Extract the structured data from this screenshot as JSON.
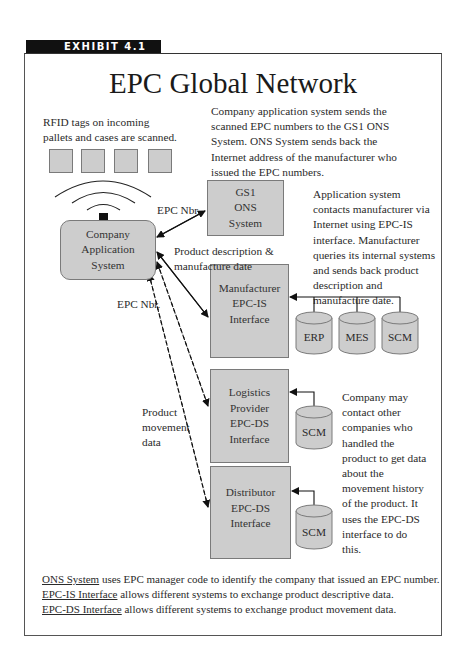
{
  "exhibit_label": "EXHIBIT 4.1",
  "title": "EPC Global Network",
  "notes": {
    "rfid": [
      "RFID tags on incoming",
      "pallets and cases are scanned."
    ],
    "ons": [
      "Company application system sends the",
      "scanned EPC numbers to the GS1 ONS",
      "System. ONS System sends back the",
      "Internet address of the manufacturer who",
      "issued the EPC numbers."
    ],
    "app_contact": [
      "Application system",
      "contacts manufacturer via",
      "Internet using EPC-IS",
      "interface. Manufacturer",
      "queries its internal systems",
      "and sends back product",
      "description and",
      "manufacture date."
    ],
    "movement": [
      "Company may",
      "contact other",
      "companies who",
      "handled the",
      "product to get data",
      "about the",
      "movement history",
      "of the product.  It",
      "uses the EPC-DS",
      "interface to do",
      "this."
    ]
  },
  "nodes": {
    "company_app": [
      "Company",
      "Application",
      "System"
    ],
    "gs1": [
      "GS1",
      "ONS",
      "System"
    ],
    "manufacturer": [
      "Manufacturer",
      "EPC-IS",
      "Interface"
    ],
    "logistics": [
      "Logistics",
      "Provider",
      "EPC-DS",
      "Interface"
    ],
    "distributor": [
      "Distributor",
      "EPC-DS",
      "Interface"
    ]
  },
  "databases": {
    "erp": "ERP",
    "mes": "MES",
    "scm_manufacturer": "SCM",
    "scm_logistics": "SCM",
    "scm_distributor": "SCM"
  },
  "edge_labels": {
    "epc_nbr_top": "EPC Nbr.",
    "product_desc": [
      "Product description &",
      "manufacture date"
    ],
    "epc_nbr_left": "EPC Nbr.",
    "product_movement": [
      "Product",
      "movement",
      "data"
    ]
  },
  "footnotes": [
    {
      "term": "ONS System",
      "text": " uses EPC manager code to identify the company that issued an EPC number."
    },
    {
      "term": "EPC-IS Interface",
      "text": " allows different systems to exchange product descriptive data."
    },
    {
      "term": "EPC-DS Interface",
      "text": " allows different systems to exchange product movement data."
    }
  ],
  "colors": {
    "box_fill": "#cdcdcd",
    "box_border": "#7a7a7a",
    "banner": "#111111"
  }
}
